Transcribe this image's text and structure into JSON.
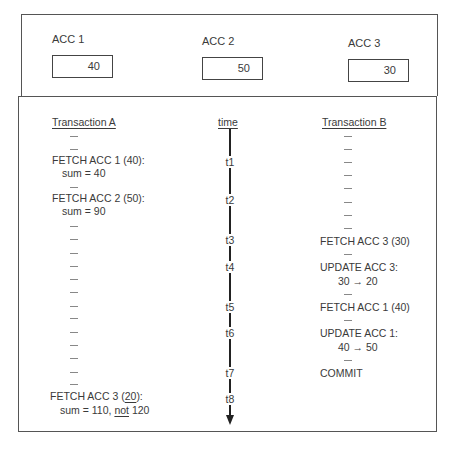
{
  "accounts": [
    {
      "label": "ACC 1",
      "value": "40"
    },
    {
      "label": "ACC 2",
      "value": "50"
    },
    {
      "label": "ACC 3",
      "value": "30"
    }
  ],
  "transaction_a": {
    "title": "Transaction A",
    "fetch1": "FETCH ACC 1 (40):",
    "sum1": "sum  =  40",
    "fetch2": "FETCH ACC 2 (50):",
    "sum2": "sum  =  90",
    "fetch3_prefix": "FETCH ACC 3 (",
    "fetch3_value": "20",
    "fetch3_suffix": "):",
    "sum3_prefix": "sum  =  110, ",
    "sum3_not": "not",
    "sum3_suffix": " 120"
  },
  "time": {
    "title": "time",
    "labels": [
      "t1",
      "t2",
      "t3",
      "t4",
      "t5",
      "t6",
      "t7",
      "t8"
    ]
  },
  "transaction_b": {
    "title": "Transaction B",
    "fetch3": "FETCH ACC 3 (30)",
    "update3": "UPDATE ACC 3:",
    "update3_change": "30 → 20",
    "fetch1": "FETCH ACC 1 (40)",
    "update1": "UPDATE ACC 1:",
    "update1_change": "40 → 50",
    "commit": "COMMIT"
  }
}
